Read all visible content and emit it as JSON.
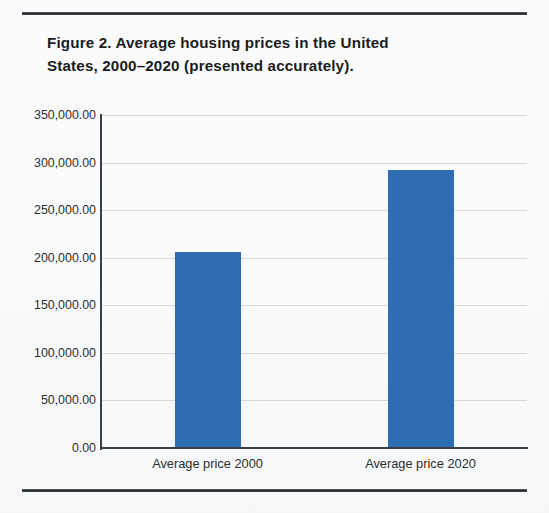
{
  "figure": {
    "title_line1": "Figure 2. Average housing prices in the United",
    "title_line2": "States, 2000–2020 (presented accurately)."
  },
  "chart_data": {
    "type": "bar",
    "title": "Figure 2. Average housing prices in the United States, 2000–2020 (presented accurately).",
    "categories": [
      "Average price 2000",
      "Average price 2020"
    ],
    "values": [
      206000,
      292000
    ],
    "value_labels": [
      "206,000.00",
      "292,000.00"
    ],
    "xlabel": "",
    "ylabel": "",
    "ylim": [
      0,
      350000
    ],
    "ytick_values": [
      0,
      50000,
      100000,
      150000,
      200000,
      250000,
      300000,
      350000
    ],
    "ytick_labels": [
      "0.00",
      "50,000.00",
      "100,000.00",
      "150,000.00",
      "200,000.00",
      "250,000.00",
      "300,000.00",
      "350,000.00"
    ],
    "grid": true,
    "legend": false,
    "bar_color": "#2e6cb3",
    "axis_color": "#3c3f43",
    "grid_color": "#d6d8da"
  }
}
